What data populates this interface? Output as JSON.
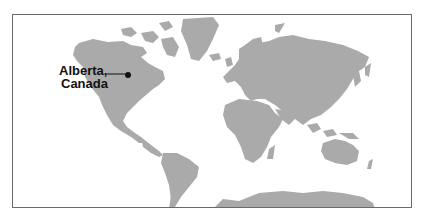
{
  "map": {
    "type": "world-map",
    "land_color": "#aaaaaa",
    "border_color": "#6a6a6a",
    "marker": {
      "label_line1": "Alberta,",
      "label_line2": "Canada",
      "color": "#111111"
    }
  }
}
